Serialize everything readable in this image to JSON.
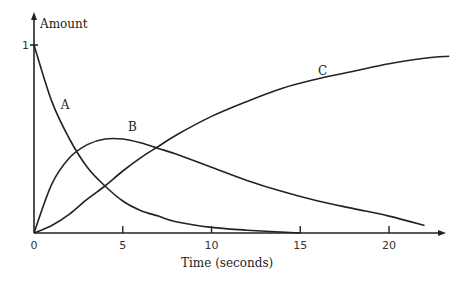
{
  "chart_data": {
    "type": "line",
    "title": "",
    "xlabel": "Time (seconds)",
    "ylabel": "Amount",
    "xlim": [
      0,
      23.5
    ],
    "ylim": [
      0,
      1
    ],
    "x_ticks": [
      0,
      5,
      10,
      15,
      20
    ],
    "y_ticks": [
      1
    ],
    "grid": false,
    "legend": "inline curve labels",
    "x": [
      0,
      1,
      2,
      3,
      4,
      5,
      6,
      7,
      8,
      10,
      12,
      14,
      16,
      18,
      20,
      22
    ],
    "series": [
      {
        "name": "A",
        "values": [
          1.0,
          0.7,
          0.5,
          0.35,
          0.25,
          0.17,
          0.12,
          0.09,
          0.06,
          0.03,
          0.015,
          0.007,
          0.004,
          0.002,
          0.001,
          0.0
        ]
      },
      {
        "name": "B",
        "values": [
          0.0,
          0.26,
          0.4,
          0.47,
          0.5,
          0.5,
          0.48,
          0.45,
          0.42,
          0.35,
          0.28,
          0.22,
          0.17,
          0.13,
          0.09,
          0.04
        ]
      },
      {
        "name": "C",
        "values": [
          0.0,
          0.04,
          0.1,
          0.18,
          0.25,
          0.33,
          0.4,
          0.46,
          0.52,
          0.62,
          0.7,
          0.77,
          0.82,
          0.86,
          0.9,
          0.93
        ]
      }
    ],
    "curve_labels": [
      {
        "text": "A",
        "x": 1.5,
        "y": 0.66
      },
      {
        "text": "B",
        "x": 5.3,
        "y": 0.54
      },
      {
        "text": "C",
        "x": 16.0,
        "y": 0.84
      }
    ]
  },
  "axis": {
    "y_label": "Amount",
    "y_tick_label": "1",
    "x_label": "Time (seconds)",
    "x_tick_labels": [
      "0",
      "5",
      "10",
      "15",
      "20"
    ]
  }
}
